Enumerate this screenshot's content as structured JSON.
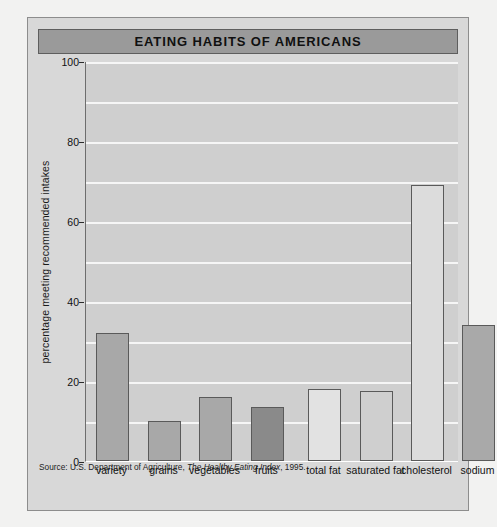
{
  "figure": {
    "title": "EATING HABITS OF AMERICANS",
    "source_prefix": "Source: U.S. Department of Agriculture, ",
    "source_italic": "The Healthy Eating Index",
    "source_suffix": ", 1995."
  },
  "chart_data": {
    "type": "bar",
    "title": "EATING HABITS OF AMERICANS",
    "xlabel": "",
    "ylabel": "percentage meeting recommended intakes",
    "ylim": [
      0,
      100
    ],
    "yticks": [
      0,
      20,
      40,
      60,
      80,
      100
    ],
    "ytick_labels": [
      "0",
      "20",
      "40",
      "60",
      "80",
      "100"
    ],
    "gridlines": [
      10,
      20,
      30,
      40,
      50,
      60,
      70,
      80,
      90,
      100
    ],
    "grid": true,
    "legend": "none",
    "categories": [
      "variety",
      "grains",
      "vegetables",
      "fruits",
      "total fat",
      "saturated fat",
      "cholesterol",
      "sodium"
    ],
    "values": [
      32,
      10,
      16,
      13.5,
      18,
      17.5,
      69,
      34
    ],
    "bar_colors": [
      "#a8a8a8",
      "#a8a8a8",
      "#a8a8a8",
      "#8a8a8a",
      "#e2e2e2",
      "#cfcfcf",
      "#dcdcdc",
      "#a9a9a9"
    ],
    "bars": [
      {
        "label": "variety",
        "value": 32,
        "color": "#a8a8a8"
      },
      {
        "label": "grains",
        "value": 10,
        "color": "#a8a8a8"
      },
      {
        "label": "vegetables",
        "value": 16,
        "color": "#a8a8a8"
      },
      {
        "label": "fruits",
        "value": 13.5,
        "color": "#8a8a8a"
      },
      {
        "label": "total fat",
        "value": 18,
        "color": "#e2e2e2"
      },
      {
        "label": "saturated fat",
        "value": 17.5,
        "color": "#cfcfcf"
      },
      {
        "label": "cholesterol",
        "value": 69,
        "color": "#dcdcdc"
      },
      {
        "label": "sodium",
        "value": 34,
        "color": "#a9a9a9"
      }
    ]
  }
}
